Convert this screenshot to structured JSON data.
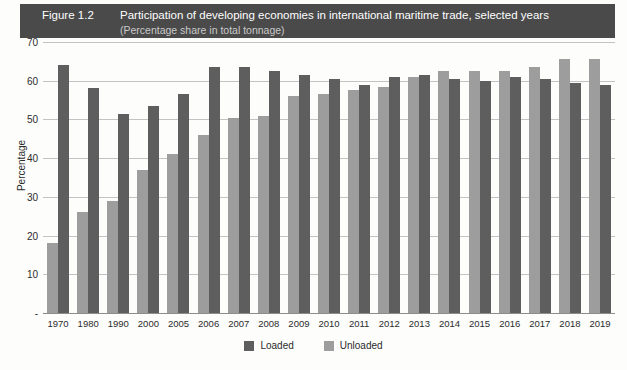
{
  "figure": {
    "number": "Figure 1.2",
    "title": "Participation of developing economies in international maritime trade, selected years",
    "subtitle": "(Percentage share in total tonnage)"
  },
  "legend": {
    "loaded_label": "Loaded",
    "unloaded_label": "Unloaded",
    "loaded_color": "#5e5e5e",
    "unloaded_color": "#9d9d9d"
  },
  "colors": {
    "title_bar_bg": "#4a4a4a",
    "title_text": "#ffffff",
    "subtitle_text": "#c9c9c9",
    "gridline": "#c3c3c3",
    "background": "#fdfdfc"
  },
  "chart_data": {
    "type": "bar",
    "title": "Participation of developing economies in international maritime trade, selected years",
    "subtitle": "(Percentage share in total tonnage)",
    "xlabel": "",
    "ylabel": "Percentage",
    "ylim": [
      0,
      70
    ],
    "yticks": [
      0,
      10,
      20,
      30,
      40,
      50,
      60,
      70
    ],
    "ytick_labels": [
      "-",
      "10",
      "20",
      "30",
      "40",
      "50",
      "60",
      "70"
    ],
    "grid": true,
    "legend_position": "bottom-center",
    "bar_order": [
      "Unloaded",
      "Loaded"
    ],
    "categories": [
      "1970",
      "1980",
      "1990",
      "2000",
      "2005",
      "2006",
      "2007",
      "2008",
      "2009",
      "2010",
      "2011",
      "2012",
      "2013",
      "2014",
      "2015",
      "2016",
      "2017",
      "2018",
      "2019"
    ],
    "series": [
      {
        "name": "Unloaded",
        "color": "#9d9d9d",
        "values": [
          18.0,
          26.0,
          29.0,
          37.0,
          41.0,
          46.0,
          50.5,
          51.0,
          56.0,
          56.5,
          57.5,
          58.5,
          61.0,
          62.5,
          62.5,
          62.5,
          63.5,
          65.5,
          65.5
        ]
      },
      {
        "name": "Loaded",
        "color": "#5e5e5e",
        "values": [
          64.0,
          58.0,
          51.5,
          53.5,
          56.5,
          63.5,
          63.5,
          62.5,
          61.5,
          60.5,
          59.0,
          61.0,
          61.5,
          60.5,
          60.0,
          61.0,
          60.5,
          59.5,
          59.0
        ]
      }
    ]
  }
}
